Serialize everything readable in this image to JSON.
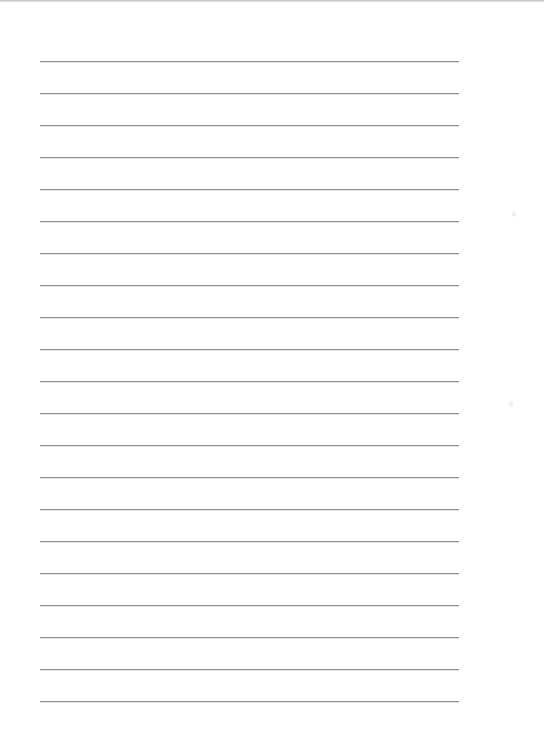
{
  "page": {
    "type": "lined-paper",
    "background": "#ffffff",
    "rule_color": "#8f8f8f",
    "rule_count": 21,
    "rule_left": 40,
    "rule_right": 459,
    "first_rule_y": 61,
    "rule_spacing": 32
  }
}
